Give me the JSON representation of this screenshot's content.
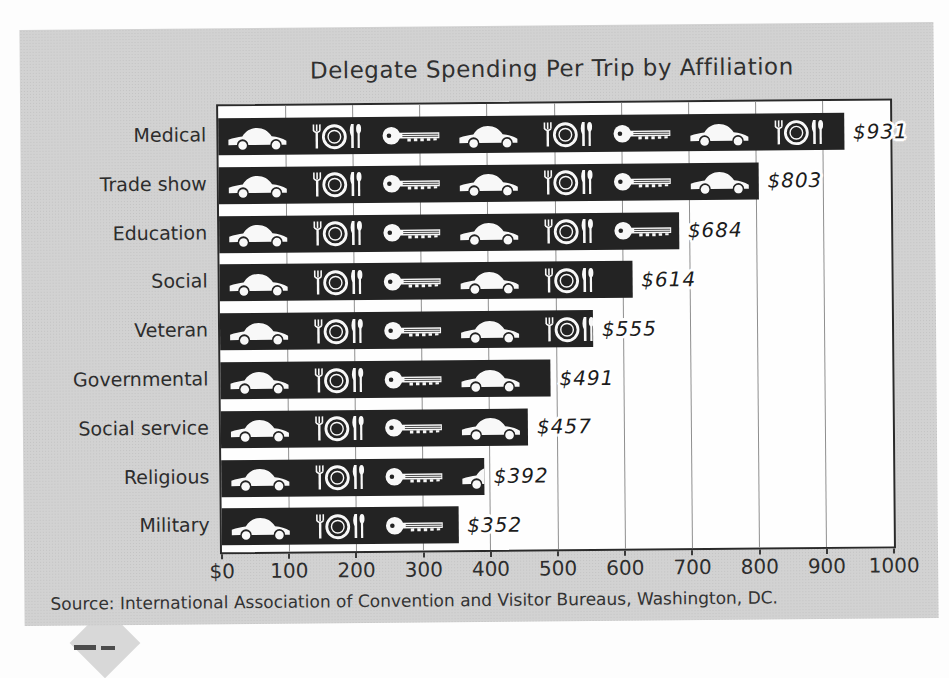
{
  "title": "Delegate Spending Per Trip by Affiliation",
  "source": "Source: International Association of Convention and Visitor Bureaus, Washington, DC.",
  "chart_data": {
    "type": "bar",
    "orientation": "horizontal",
    "title": "Delegate Spending Per Trip by Affiliation",
    "categories": [
      "Medical",
      "Trade show",
      "Education",
      "Social",
      "Veteran",
      "Governmental",
      "Social service",
      "Religious",
      "Military"
    ],
    "values": [
      931,
      803,
      684,
      614,
      555,
      491,
      457,
      392,
      352
    ],
    "value_labels": [
      "$931",
      "$803",
      "$684",
      "$614",
      "$555",
      "$491",
      "$457",
      "$392",
      "$352"
    ],
    "bar_icons": [
      [
        "car",
        "place-setting",
        "key",
        "car",
        "place-setting",
        "key",
        "car",
        "place-setting"
      ],
      [
        "car",
        "place-setting",
        "key",
        "car",
        "place-setting",
        "key",
        "car"
      ],
      [
        "car",
        "place-setting",
        "key",
        "car",
        "place-setting",
        "key"
      ],
      [
        "car",
        "place-setting",
        "key",
        "car",
        "place-setting"
      ],
      [
        "car",
        "place-setting",
        "key",
        "car",
        "place-setting"
      ],
      [
        "car",
        "place-setting",
        "key",
        "car"
      ],
      [
        "car",
        "place-setting",
        "key",
        "car"
      ],
      [
        "car",
        "place-setting",
        "key",
        "car"
      ],
      [
        "car",
        "place-setting",
        "key"
      ]
    ],
    "icon_names": [
      "car-icon",
      "place-setting-icon",
      "key-icon"
    ],
    "icon_unit_value": 115,
    "xlim": [
      0,
      1000
    ],
    "x_tick_values": [
      0,
      100,
      200,
      300,
      400,
      500,
      600,
      700,
      800,
      900,
      1000
    ],
    "x_tick_labels": [
      "$0",
      "100",
      "200",
      "300",
      "400",
      "500",
      "600",
      "700",
      "800",
      "900",
      "1000"
    ],
    "grid": true,
    "legend": "none",
    "source": "Source: International Association of Convention and Visitor Bureaus, Washington, DC.",
    "colors": {
      "panel": "#d2d2d2",
      "plot_bg": "#fefefe",
      "bar": "#232323",
      "icon": "#f8f8f8",
      "grid": "#8f8f8f",
      "plot_border": "#2a2a2a",
      "text": "#2f2f2f"
    }
  }
}
